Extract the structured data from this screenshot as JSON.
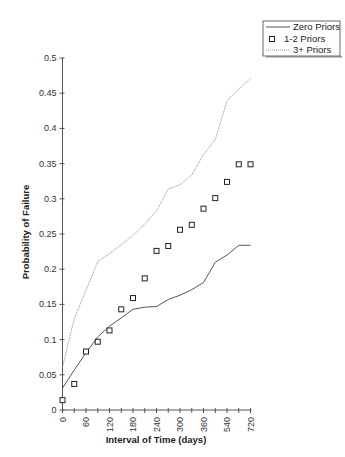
{
  "chart_data": {
    "type": "line",
    "title": "",
    "xlabel": "Interval of Time (days)",
    "ylabel": "Probability of Failure",
    "ylim": [
      0,
      0.5
    ],
    "yticks": [
      0,
      0.05,
      0.1,
      0.15,
      0.2,
      0.25,
      0.3,
      0.35,
      0.4,
      0.45,
      0.5
    ],
    "ytick_labels": [
      "0",
      "0.05",
      "0.1",
      "0.15",
      "0.2",
      "0.25",
      "0.3",
      "0.35",
      "0.4",
      "0.45",
      "0.5"
    ],
    "categories": [
      0,
      30,
      60,
      90,
      120,
      150,
      180,
      210,
      240,
      270,
      300,
      330,
      360,
      450,
      540,
      630,
      720
    ],
    "xtick_labels": [
      "0",
      "60",
      "120",
      "180",
      "240",
      "300",
      "360",
      "540",
      "720"
    ],
    "grid": false,
    "legend_position": "top-right",
    "series": [
      {
        "name": "Zero Priors",
        "style": "solid-line",
        "color": "#555555",
        "values": [
          0.031,
          0.057,
          0.081,
          0.104,
          0.119,
          0.131,
          0.143,
          0.146,
          0.147,
          0.157,
          0.163,
          0.171,
          0.181,
          0.21,
          0.22,
          0.234,
          0.234
        ]
      },
      {
        "name": "1-2 Priors",
        "style": "square-markers",
        "color": "#222222",
        "values": [
          0.014,
          0.037,
          0.083,
          0.097,
          0.113,
          0.143,
          0.159,
          0.187,
          0.226,
          0.233,
          0.256,
          0.263,
          0.286,
          0.301,
          0.324,
          0.349,
          0.349
        ]
      },
      {
        "name": "3+ Priors",
        "style": "dotted-line",
        "color": "#888888",
        "values": [
          0.061,
          0.13,
          0.17,
          0.211,
          0.222,
          0.235,
          0.248,
          0.264,
          0.283,
          0.314,
          0.32,
          0.334,
          0.363,
          0.384,
          0.439,
          0.456,
          0.471
        ]
      }
    ]
  },
  "legend": {
    "items": [
      {
        "label": "Zero Priors",
        "symbol": "solid-line"
      },
      {
        "label": "1-2 Priors",
        "symbol": "square-marker"
      },
      {
        "label": "3+ Priors",
        "symbol": "dotted-line"
      }
    ]
  }
}
